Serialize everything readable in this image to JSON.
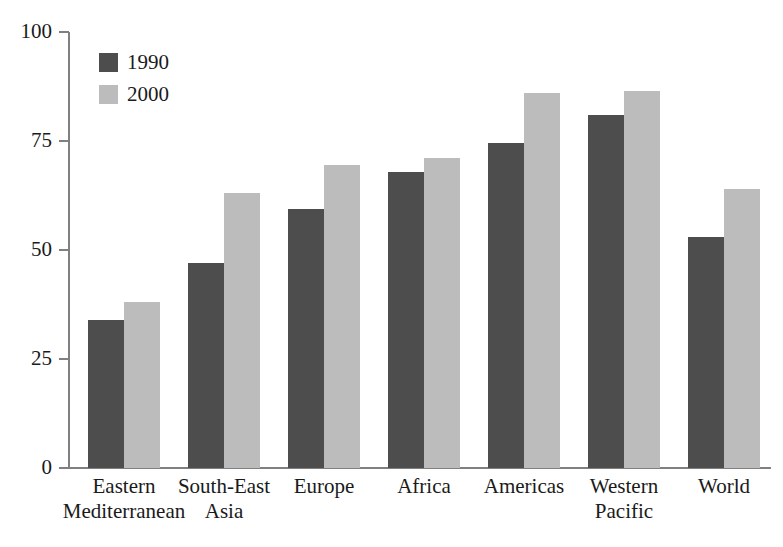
{
  "chart_data": {
    "type": "bar",
    "title": "",
    "subtitle": "",
    "xlabel": "",
    "ylabel": "",
    "ylim": [
      0,
      100
    ],
    "yticks": [
      0,
      25,
      50,
      75,
      100
    ],
    "ytick_labels": [
      "0",
      "25",
      "50",
      "75",
      "100"
    ],
    "grid": false,
    "legend_position": "top-left",
    "categories": [
      "Eastern Mediterranean",
      "South-East Asia",
      "Europe",
      "Africa",
      "Americas",
      "Western Pacific",
      "World"
    ],
    "category_label_lines": [
      [
        "Eastern",
        "Mediterranean"
      ],
      [
        "South-East",
        "Asia"
      ],
      [
        "Europe",
        ""
      ],
      [
        "Africa",
        ""
      ],
      [
        "Americas",
        ""
      ],
      [
        "Western",
        "Pacific"
      ],
      [
        "World",
        ""
      ]
    ],
    "series": [
      {
        "name": "1990",
        "color": "#4d4d4d",
        "values": [
          34,
          47,
          59.5,
          68,
          74.5,
          81,
          53
        ]
      },
      {
        "name": "2000",
        "color": "#bcbcbc",
        "values": [
          38,
          63,
          69.5,
          71,
          86,
          86.5,
          64
        ]
      }
    ]
  },
  "legend": {
    "items": [
      {
        "label": "1990",
        "color": "#4d4d4d"
      },
      {
        "label": "2000",
        "color": "#bcbcbc"
      }
    ]
  },
  "axis": {
    "y_tick_labels": [
      "100",
      "75",
      "50",
      "25",
      "0"
    ]
  }
}
